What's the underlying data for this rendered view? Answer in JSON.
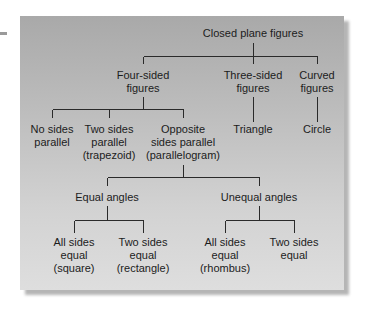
{
  "diagram": {
    "type": "tree",
    "root": {
      "id": "closed-plane-figures",
      "lines": [
        "Closed plane figures"
      ],
      "children": [
        {
          "id": "four-sided",
          "lines": [
            "Four-sided",
            "figures"
          ],
          "children": [
            {
              "id": "no-sides-parallel",
              "lines": [
                "No sides",
                "parallel"
              ]
            },
            {
              "id": "trapezoid",
              "lines": [
                "Two sides",
                "parallel",
                "(trapezoid)"
              ]
            },
            {
              "id": "parallelogram",
              "lines": [
                "Opposite",
                "sides parallel",
                "(parallelogram)"
              ],
              "children": [
                {
                  "id": "equal-angles",
                  "lines": [
                    "Equal angles"
                  ],
                  "children": [
                    {
                      "id": "square",
                      "lines": [
                        "All sides",
                        "equal",
                        "(square)"
                      ]
                    },
                    {
                      "id": "rectangle",
                      "lines": [
                        "Two sides",
                        "equal",
                        "(rectangle)"
                      ]
                    }
                  ]
                },
                {
                  "id": "unequal-angles",
                  "lines": [
                    "Unequal angles"
                  ],
                  "children": [
                    {
                      "id": "rhombus",
                      "lines": [
                        "All sides",
                        "equal",
                        "(rhombus)"
                      ]
                    },
                    {
                      "id": "two-sides-equal",
                      "lines": [
                        "Two sides",
                        "equal"
                      ]
                    }
                  ]
                }
              ]
            }
          ]
        },
        {
          "id": "three-sided",
          "lines": [
            "Three-sided",
            "figures"
          ],
          "children": [
            {
              "id": "triangle",
              "lines": [
                "Triangle"
              ]
            }
          ]
        },
        {
          "id": "curved",
          "lines": [
            "Curved",
            "figures"
          ],
          "children": [
            {
              "id": "circle",
              "lines": [
                "Circle"
              ]
            }
          ]
        }
      ]
    }
  },
  "labels": {
    "root": [
      "Closed plane figures"
    ],
    "four_sided": [
      "Four-sided",
      "figures"
    ],
    "three_sided": [
      "Three-sided",
      "figures"
    ],
    "curved": [
      "Curved",
      "figures"
    ],
    "no_sides_parallel": [
      "No sides",
      "parallel"
    ],
    "trapezoid": [
      "Two sides",
      "parallel",
      "(trapezoid)"
    ],
    "parallelogram": [
      "Opposite",
      "sides parallel",
      "(parallelogram)"
    ],
    "triangle": [
      "Triangle"
    ],
    "circle": [
      "Circle"
    ],
    "equal_angles": [
      "Equal angles"
    ],
    "unequal_angles": [
      "Unequal angles"
    ],
    "square": [
      "All sides",
      "equal",
      "(square)"
    ],
    "rectangle": [
      "Two sides",
      "equal",
      "(rectangle)"
    ],
    "rhombus": [
      "All sides",
      "equal",
      "(rhombus)"
    ],
    "two_sides_equal": [
      "Two sides",
      "equal"
    ]
  },
  "colors": {
    "panel_top": "#a9a9a9",
    "panel_bottom": "#dedede",
    "line": "#2a2a2a",
    "text": "#1c1c1c"
  }
}
